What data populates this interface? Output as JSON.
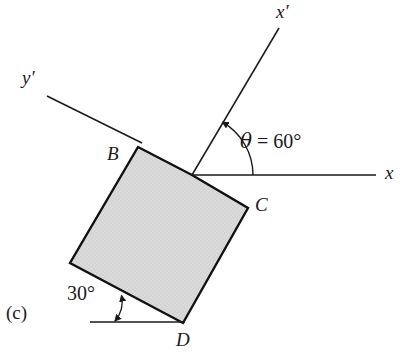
{
  "figure": {
    "part_label": "(c)",
    "colors": {
      "background": "#ffffff",
      "stroke": "#1a1a1a",
      "square_fill": "#d6d6d6",
      "square_edge": "#111111",
      "text": "#1a1a1a"
    },
    "labels": {
      "x_axis": "x",
      "y_axis": "y",
      "x_prime_axis": "x′",
      "y_prime_axis": "y′",
      "vertex_b": "B",
      "vertex_c": "C",
      "vertex_d": "D",
      "theta_symbol": "θ",
      "theta_equation_tail": " = 60°",
      "theta_full": "θ = 60°",
      "incline_angle": "30°"
    },
    "values": {
      "theta_degrees": 60,
      "incline_degrees": 30,
      "square_rotation_degrees": 30
    },
    "geometry": {
      "origin": {
        "x": 192,
        "y": 175
      },
      "square_vertices": [
        {
          "name": "B",
          "x": 138,
          "y": 147
        },
        {
          "name": "O",
          "x": 192,
          "y": 175
        },
        {
          "name": "C",
          "x": 248,
          "y": 208
        },
        {
          "name": "D",
          "x": 183,
          "y": 323
        },
        {
          "name": "A",
          "x": 70,
          "y": 263
        }
      ],
      "x_axis_line": {
        "x1": 192,
        "y1": 175,
        "x2": 376,
        "y2": 175
      },
      "x_prime_line": {
        "x1": 192,
        "y1": 175,
        "x2": 279,
        "y2": 28
      },
      "y_prime_line": {
        "x1": 142,
        "y1": 143,
        "x2": 47,
        "y2": 96
      },
      "base_reference_line": {
        "x1": 90,
        "y1": 322,
        "x2": 185,
        "y2": 322
      },
      "theta_arc_radius": 61,
      "incline_arc_radius": 30
    },
    "label_positions": {
      "x_axis": {
        "left": 385,
        "top": 163
      },
      "x_prime": {
        "left": 276,
        "top": 2
      },
      "y_prime": {
        "left": 22,
        "top": 68
      },
      "vertex_b": {
        "left": 107,
        "top": 144
      },
      "vertex_c": {
        "left": 255,
        "top": 195
      },
      "vertex_d": {
        "left": 176,
        "top": 330
      },
      "theta": {
        "left": 240,
        "top": 131
      },
      "incline": {
        "left": 67,
        "top": 283
      },
      "part": {
        "left": 6,
        "top": 303
      }
    }
  }
}
